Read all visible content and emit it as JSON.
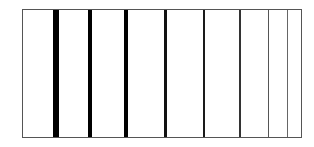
{
  "diagram": {
    "description": "Rectangle divided by vertical lines whose thickness decreases from left to right",
    "frame": {
      "left": 22,
      "top": 9,
      "width": 278,
      "height": 127,
      "border_color": "#555555",
      "fill_color": "#ffffff"
    },
    "lines": [
      {
        "index": 1,
        "x": 53,
        "width": 6,
        "color": "#000000"
      },
      {
        "index": 2,
        "x": 88,
        "width": 4,
        "color": "#000000"
      },
      {
        "index": 3,
        "x": 124,
        "width": 3.5,
        "color": "#000000"
      },
      {
        "index": 4,
        "x": 164,
        "width": 2.5,
        "color": "#111111"
      },
      {
        "index": 5,
        "x": 203,
        "width": 2,
        "color": "#1a1a1a"
      },
      {
        "index": 6,
        "x": 239,
        "width": 1.5,
        "color": "#333333"
      },
      {
        "index": 7,
        "x": 268,
        "width": 1,
        "color": "#555555"
      },
      {
        "index": 8,
        "x": 287,
        "width": 1,
        "color": "#666666"
      }
    ]
  }
}
